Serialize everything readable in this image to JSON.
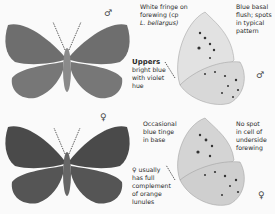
{
  "male": {
    "symbol": "♂",
    "annotations": {
      "fringe": "White fringe on forewing (cp L. bellargus)",
      "fringe_lines": [
        "White fringe on",
        "forewing (cp",
        "L. bellargus)"
      ],
      "basal": [
        "Blue basal",
        "flush; spots",
        "in typical",
        "pattern"
      ],
      "uppers_title": "Uppers",
      "uppers": [
        "bright blue",
        "with violet",
        "hue"
      ]
    }
  },
  "female": {
    "symbol": "♀",
    "annotations": {
      "tinge": [
        "Occasional",
        "blue tinge",
        "in base"
      ],
      "nospot": [
        "No spot",
        "in cell of",
        "underside",
        "forewing"
      ],
      "lunules": [
        "♀ usually",
        "has full",
        "complement",
        "of orange",
        "lunules"
      ]
    }
  },
  "colors": {
    "wing_upper_male": "#6e6e6e",
    "wing_upper_female": "#4a4a4a",
    "underside": "#dcdcdc",
    "background": "#fafafa"
  }
}
